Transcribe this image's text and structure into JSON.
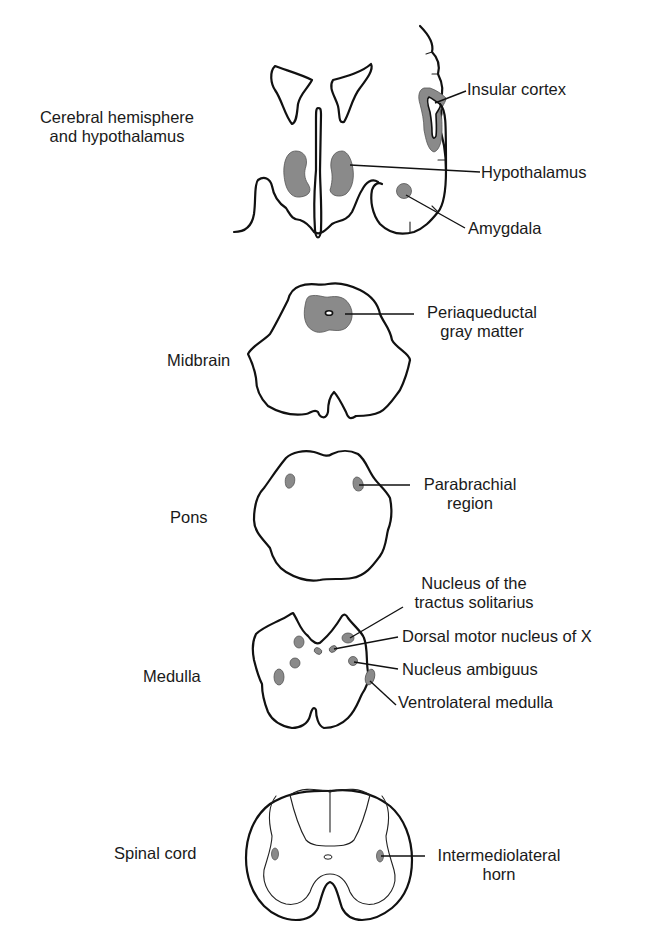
{
  "diagram": {
    "type": "anatomical-cross-sections",
    "colors": {
      "outline": "#111111",
      "highlighted_region": "#8a8a8a",
      "background": "#ffffff"
    },
    "sections": [
      {
        "id": "cerebral",
        "title": "Cerebral hemisphere\nand hypothalamus",
        "title_lines": [
          "Cerebral hemisphere",
          "and hypothalamus"
        ],
        "labels": [
          "Insular cortex",
          "Hypothalamus",
          "Amygdala"
        ]
      },
      {
        "id": "midbrain",
        "title": "Midbrain",
        "labels": [
          "Periaqueductal gray matter"
        ],
        "label_lines": [
          [
            "Periaqueductal",
            "gray matter"
          ]
        ]
      },
      {
        "id": "pons",
        "title": "Pons",
        "labels": [
          "Parabrachial region"
        ],
        "label_lines": [
          [
            "Parabrachial",
            "region"
          ]
        ]
      },
      {
        "id": "medulla",
        "title": "Medulla",
        "labels": [
          "Nucleus of the tractus solitarius",
          "Dorsal motor nucleus of X",
          "Nucleus ambiguus",
          "Ventrolateral medulla"
        ],
        "label_lines": [
          [
            "Nucleus of the",
            "tractus solitarius"
          ],
          [
            "Dorsal motor nucleus of X"
          ],
          [
            "Nucleus ambiguus"
          ],
          [
            "Ventrolateral medulla"
          ]
        ]
      },
      {
        "id": "spinal",
        "title": "Spinal cord",
        "labels": [
          "Intermediolateral horn"
        ],
        "label_lines": [
          [
            "Intermediolateral",
            "horn"
          ]
        ]
      }
    ]
  },
  "text": {
    "cerebral_title_1": "Cerebral hemisphere",
    "cerebral_title_2": "and hypothalamus",
    "insular_cortex": "Insular cortex",
    "hypothalamus": "Hypothalamus",
    "amygdala": "Amygdala",
    "midbrain_title": "Midbrain",
    "pag_1": "Periaqueductal",
    "pag_2": "gray matter",
    "pons_title": "Pons",
    "parabrachial_1": "Parabrachial",
    "parabrachial_2": "region",
    "medulla_title": "Medulla",
    "nts_1": "Nucleus of the",
    "nts_2": "tractus solitarius",
    "dmnx": "Dorsal motor nucleus of X",
    "ambiguus": "Nucleus ambiguus",
    "vlm": "Ventrolateral medulla",
    "spinal_title": "Spinal cord",
    "iml_1": "Intermediolateral",
    "iml_2": "horn"
  }
}
